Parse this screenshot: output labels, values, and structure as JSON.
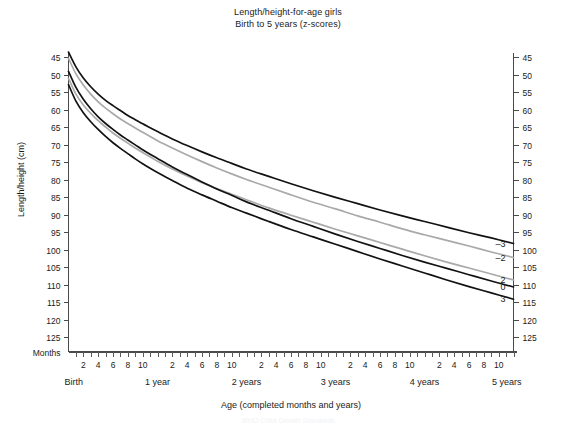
{
  "chart_data": {
    "type": "line",
    "title": "Length/height-for-age girls",
    "subtitle": "Birth to 5 years (z-scores)",
    "xlabel": "Age (completed months and years)",
    "ylabel": "Length/height (cm)",
    "months_axis_label": "Months",
    "xlim": [
      0,
      60
    ],
    "ylim": [
      43,
      127
    ],
    "grid": false,
    "legend_position": "right-axis-labels",
    "y_ticks": [
      45,
      50,
      55,
      60,
      65,
      70,
      75,
      80,
      85,
      90,
      95,
      100,
      105,
      110,
      115,
      120,
      125
    ],
    "x_month_ticks": [
      2,
      4,
      6,
      8,
      10
    ],
    "x_year_labels": [
      "Birth",
      "1 year",
      "2 years",
      "3 years",
      "4 years",
      "5 years"
    ],
    "x_year_positions": [
      0,
      12,
      24,
      36,
      48,
      60
    ],
    "x": [
      0,
      1,
      2,
      3,
      4,
      5,
      6,
      7,
      8,
      9,
      10,
      11,
      12,
      14,
      16,
      18,
      20,
      22,
      24,
      27,
      30,
      33,
      36,
      39,
      42,
      45,
      48,
      51,
      54,
      57,
      60
    ],
    "series": [
      {
        "name": "3",
        "label": "3",
        "color": "#121212",
        "style": "dark",
        "end_value": 125.0,
        "values": [
          52.9,
          57.6,
          60.9,
          63.5,
          65.7,
          67.7,
          69.5,
          71.1,
          72.6,
          74.1,
          75.5,
          76.8,
          78.0,
          80.3,
          82.5,
          84.4,
          86.2,
          88.0,
          89.6,
          92.0,
          94.3,
          96.4,
          98.5,
          100.6,
          102.7,
          104.7,
          106.7,
          108.7,
          110.6,
          112.4,
          114.2
        ]
      },
      {
        "name": "2",
        "label": "2",
        "color": "#a9a9a9",
        "style": "gray",
        "end_value": 120.5,
        "values": [
          51.1,
          55.6,
          58.7,
          61.1,
          63.2,
          65.0,
          66.7,
          68.2,
          69.6,
          71.0,
          72.3,
          73.5,
          74.8,
          77.0,
          79.0,
          80.9,
          82.6,
          84.2,
          85.8,
          88.1,
          90.2,
          92.2,
          94.2,
          96.1,
          98.0,
          99.9,
          101.8,
          103.6,
          105.3,
          107.0,
          108.7
        ]
      },
      {
        "name": "0",
        "label": "0",
        "color": "#121212",
        "style": "dark",
        "end_value": 110.0,
        "values": [
          49.1,
          53.7,
          57.1,
          59.8,
          62.1,
          64.0,
          65.7,
          67.3,
          68.7,
          70.1,
          71.5,
          72.8,
          74.0,
          76.4,
          78.6,
          80.7,
          82.7,
          84.5,
          86.4,
          88.8,
          91.2,
          93.4,
          95.6,
          97.7,
          99.7,
          101.7,
          103.6,
          105.4,
          107.2,
          109.0,
          110.7
        ]
      },
      {
        "name": "-2",
        "label": "–2",
        "color": "#a9a9a9",
        "style": "gray",
        "end_value": 100.0,
        "values": [
          45.4,
          49.8,
          53.0,
          55.6,
          57.8,
          59.6,
          61.2,
          62.7,
          64.0,
          65.3,
          66.5,
          67.7,
          68.9,
          71.0,
          73.0,
          74.9,
          76.7,
          78.4,
          80.0,
          82.2,
          84.4,
          86.5,
          88.4,
          90.4,
          92.2,
          94.1,
          95.8,
          97.4,
          99.0,
          100.7,
          102.3
        ]
      },
      {
        "name": "-3",
        "label": "–3",
        "color": "#121212",
        "style": "dark",
        "end_value": 95.0,
        "values": [
          43.6,
          47.8,
          51.0,
          53.5,
          55.6,
          57.4,
          58.9,
          60.3,
          61.7,
          62.9,
          64.1,
          65.2,
          66.3,
          68.4,
          70.3,
          72.1,
          73.8,
          75.4,
          77.0,
          79.1,
          81.2,
          83.2,
          85.1,
          86.9,
          88.7,
          90.4,
          92.0,
          93.6,
          95.2,
          96.7,
          98.3
        ]
      }
    ]
  },
  "footer": {
    "note": "WHO Child Growth Standards"
  }
}
